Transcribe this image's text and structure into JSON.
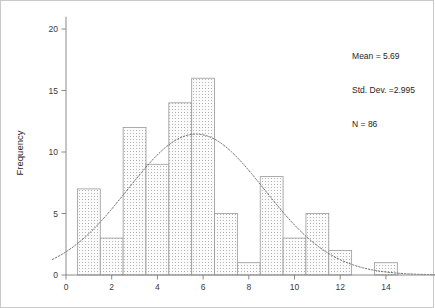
{
  "chart_data": {
    "type": "bar",
    "title": "",
    "subtitle": "",
    "xlabel": "",
    "ylabel": "Frequency",
    "xlim": [
      -0.6,
      16.2
    ],
    "ylim": [
      0,
      21
    ],
    "grid": false,
    "legend": "none",
    "bin_width": 1,
    "x_tick_labels": [
      "0",
      "2",
      "4",
      "6",
      "8",
      "10",
      "12",
      "14"
    ],
    "x_ticks": [
      0,
      2,
      4,
      6,
      8,
      10,
      12,
      14
    ],
    "y_tick_labels": [
      "0",
      "5",
      "10",
      "15",
      "20"
    ],
    "y_ticks": [
      0,
      5,
      10,
      15,
      20
    ],
    "bin_centers": [
      1,
      2,
      3,
      4,
      5,
      6,
      7,
      8,
      9,
      10,
      11,
      12,
      13,
      14
    ],
    "bin_edges": [
      0.5,
      1.5,
      2.5,
      3.5,
      4.5,
      5.5,
      6.5,
      7.5,
      8.5,
      9.5,
      10.5,
      11.5,
      12.5,
      13.5,
      14.5
    ],
    "values": [
      7,
      3,
      12,
      9,
      14,
      16,
      5,
      1,
      8,
      3,
      5,
      2,
      0,
      1
    ],
    "overlay": {
      "type": "normal-curve",
      "mean": 5.69,
      "std_dev": 2.995,
      "n": 86,
      "style": "dotted"
    },
    "annotations": {
      "mean_text": "Mean = 5.69",
      "std_dev_text": "Std. Dev. =2.995",
      "n_text": "N = 86"
    }
  },
  "colors": {
    "bar_fill": "#f2f2f2",
    "bar_stroke": "#9a9a9a",
    "bar_hatch": "#b9b9b9",
    "axis": "#8a8a8a",
    "curve": "#6f6f6f",
    "text": "#1e1e1e",
    "frame": "#c9c9c9"
  },
  "axis": {
    "y_title": "Frequency"
  },
  "stats_panel": {
    "mean": "Mean = 5.69",
    "std_dev": "Std. Dev. =2.995",
    "n": "N = 86"
  }
}
